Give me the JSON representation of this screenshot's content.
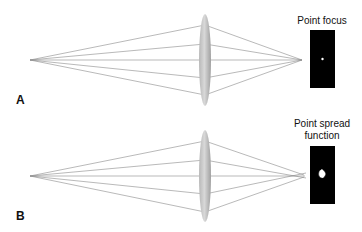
{
  "panels": [
    {
      "letter": "A",
      "title_lines": [
        "Point focus"
      ],
      "description": "Rays from a point source pass through a lens and converge to a single point"
    },
    {
      "letter": "B",
      "title_lines": [
        "Point spread",
        "function"
      ],
      "description": "Rays from a point source pass through a lens and converge to a spread (blurred) spot"
    }
  ],
  "colors": {
    "ray": "#8a8a8a",
    "lens_edge": "#9a9a9a",
    "detector": "#000000",
    "spot": "#ffffff"
  }
}
